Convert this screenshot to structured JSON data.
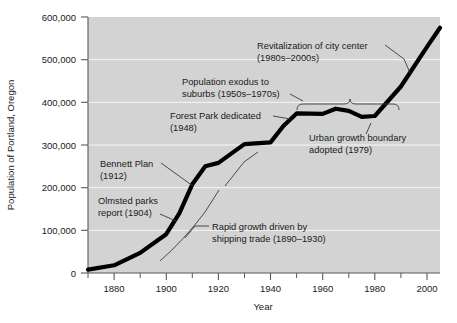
{
  "chart_data": {
    "type": "line",
    "title": "",
    "xlabel": "Year",
    "ylabel": "Population of Portland, Oregon",
    "xlim": [
      1870,
      2005
    ],
    "ylim": [
      0,
      600000
    ],
    "grid": true,
    "legend": "none",
    "x_ticks": [
      "1880",
      "1900",
      "1920",
      "1940",
      "1960",
      "1980",
      "2000"
    ],
    "x_tick_values": [
      1880,
      1900,
      1920,
      1940,
      1960,
      1980,
      2000
    ],
    "x_minor_tick_values": [
      1870,
      1890,
      1910,
      1930,
      1950,
      1970,
      1990
    ],
    "y_ticks": [
      "0",
      "100,000",
      "200,000",
      "300,000",
      "400,000",
      "500,000",
      "600,000"
    ],
    "y_tick_values": [
      0,
      100000,
      200000,
      300000,
      400000,
      500000,
      600000
    ],
    "series": [
      {
        "name": "Population of Portland, Oregon",
        "x": [
          1870,
          1880,
          1890,
          1900,
          1905,
          1910,
          1915,
          1920,
          1930,
          1940,
          1945,
          1950,
          1960,
          1965,
          1970,
          1975,
          1980,
          1990,
          2000,
          2005
        ],
        "values": [
          8000,
          18000,
          47000,
          91000,
          140000,
          208000,
          250000,
          258000,
          302000,
          306000,
          345000,
          374000,
          373000,
          385000,
          380000,
          366000,
          368000,
          437000,
          530000,
          575000
        ]
      }
    ],
    "annotations": [
      {
        "id": "revitalization",
        "lines": [
          "Revitalization of city center",
          "(1980s–2000s)"
        ],
        "period": "1980s–2000s"
      },
      {
        "id": "population-exodus",
        "lines": [
          "Population exodus to",
          "suburbs (1950s–1970s)"
        ],
        "period": "1950s–1970s"
      },
      {
        "id": "forest-park",
        "lines": [
          "Forest Park dedicated",
          "(1948)"
        ],
        "period": "1948"
      },
      {
        "id": "urban-growth-boundary",
        "lines": [
          "Urban growth boundary",
          "adopted (1979)"
        ],
        "period": "1979"
      },
      {
        "id": "bennett-plan",
        "lines": [
          "Bennett Plan",
          "(1912)"
        ],
        "period": "1912"
      },
      {
        "id": "olmsted-parks",
        "lines": [
          "Olmsted parks",
          "report (1904)"
        ],
        "period": "1904"
      },
      {
        "id": "rapid-growth",
        "lines": [
          "Rapid growth driven by",
          "shipping trade (1890–1930)"
        ],
        "period": "1890–1930"
      }
    ],
    "colors": {
      "line": "#000000",
      "plot_background": "#d3d3d3",
      "page_background": "#ffffff",
      "axis": "#555a5c",
      "gridline": "#ffffff",
      "text": "#1a1a1a"
    }
  }
}
